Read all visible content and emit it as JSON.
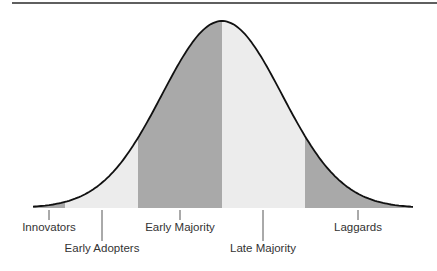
{
  "chart_data": {
    "type": "area",
    "title": "",
    "xlabel": "",
    "ylabel": "",
    "grid": false,
    "legend": "none",
    "categories": [
      "Innovators",
      "Early Adopters",
      "Early Majority",
      "Late Majority",
      "Laggards"
    ],
    "segments": [
      {
        "name": "Innovators",
        "x_start": 33,
        "x_end": 65,
        "fill": "#a9a9a9"
      },
      {
        "name": "Early Adopters",
        "x_start": 65,
        "x_end": 138,
        "fill": "#ececec"
      },
      {
        "name": "Early Majority",
        "x_start": 138,
        "x_end": 222,
        "fill": "#a9a9a9"
      },
      {
        "name": "Late Majority",
        "x_start": 222,
        "x_end": 305,
        "fill": "#ececec"
      },
      {
        "name": "Laggards",
        "x_start": 305,
        "x_end": 413,
        "fill": "#a9a9a9"
      }
    ]
  },
  "labels": [
    {
      "text": "Innovators",
      "tick_x": 49,
      "row": 1
    },
    {
      "text": "Early Adopters",
      "tick_x": 102,
      "row": 2
    },
    {
      "text": "Early Majority",
      "tick_x": 180,
      "row": 1
    },
    {
      "text": "Late Majority",
      "tick_x": 263,
      "row": 2
    },
    {
      "text": "Laggards",
      "tick_x": 358,
      "row": 1
    }
  ],
  "colors": {
    "dark_fill": "#a9a9a9",
    "light_fill": "#ececec",
    "curve": "#111111",
    "rule": "#2a2a2a",
    "tick": "#555555",
    "text": "#333333"
  }
}
